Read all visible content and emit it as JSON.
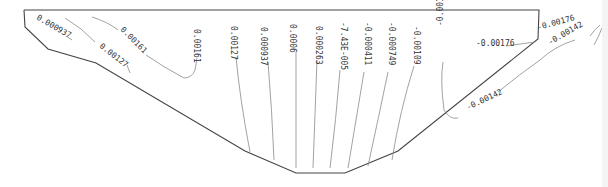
{
  "diagram": {
    "type": "contour",
    "boundary": {
      "color": "#444444",
      "points": [
        [
          24,
          10
        ],
        [
          539,
          10
        ],
        [
          538,
          39
        ],
        [
          398,
          151
        ],
        [
          345,
          173
        ],
        [
          296,
          173
        ],
        [
          245,
          151
        ],
        [
          96,
          63
        ],
        [
          48,
          49
        ],
        [
          25,
          27
        ],
        [
          24,
          10
        ]
      ]
    },
    "contour_color": "#888888",
    "labels": [
      {
        "id": "l1",
        "text": "0.000937",
        "x": 36,
        "y": 19,
        "rot": 30
      },
      {
        "id": "l2",
        "text": "0.00127",
        "x": 99,
        "y": 47,
        "rot": 38
      },
      {
        "id": "l3",
        "text": "0.00161",
        "x": 120,
        "y": 30,
        "rot": 45
      },
      {
        "id": "l4",
        "text": "0.00161",
        "x": 194,
        "y": 29,
        "rot": 90
      },
      {
        "id": "l5",
        "text": "0.00127",
        "x": 231,
        "y": 26,
        "rot": 90
      },
      {
        "id": "l6",
        "text": "0.000937",
        "x": 261,
        "y": 27,
        "rot": 90
      },
      {
        "id": "l7",
        "text": "0.0006",
        "x": 290,
        "y": 24,
        "rot": 90
      },
      {
        "id": "l8",
        "text": "0.000263",
        "x": 316,
        "y": 26,
        "rot": 90
      },
      {
        "id": "l9",
        "text": "-7.43E-005",
        "x": 341,
        "y": 22,
        "rot": 90
      },
      {
        "id": "l10",
        "text": "-0.000411",
        "x": 365,
        "y": 22,
        "rot": 90
      },
      {
        "id": "l11",
        "text": "-0.000749",
        "x": 389,
        "y": 22,
        "rot": 90
      },
      {
        "id": "l12",
        "text": "-0.00109",
        "x": 414,
        "y": 26,
        "rot": 90
      },
      {
        "id": "l13",
        "text": "-0.00142",
        "x": 443,
        "y": 26,
        "rot": -90
      },
      {
        "id": "l14",
        "text": "-0.00176",
        "x": 476,
        "y": 46,
        "rot": 0
      },
      {
        "id": "l15",
        "text": "-0.00176",
        "x": 538,
        "y": 30,
        "rot": -15
      },
      {
        "id": "l16",
        "text": "-0.00142",
        "x": 550,
        "y": 45,
        "rot": -30
      },
      {
        "id": "l17",
        "text": "-0.00142",
        "x": 468,
        "y": 110,
        "rot": -25
      }
    ]
  }
}
